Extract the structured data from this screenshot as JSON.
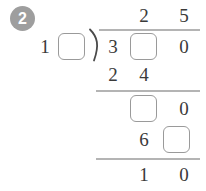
{
  "problem": {
    "badge_label": "2",
    "divisor": {
      "tens": "1",
      "ones_box": ""
    },
    "quotient": {
      "tens": "2",
      "ones": "5"
    },
    "dividend": {
      "hundreds": "3",
      "tens_box": "",
      "ones": "0"
    },
    "subtract_first": {
      "tens": "2",
      "ones": "4"
    },
    "bring_down": {
      "tens_box": "",
      "ones": "0"
    },
    "subtract_second": {
      "tens": "6",
      "ones_box": ""
    },
    "remainder": {
      "tens": "1",
      "ones": "0"
    }
  },
  "colors": {
    "digit": "#3a3a3a",
    "box_border": "#9a9a9a",
    "rule": "#b4b4b4",
    "badge_bg": "#9e9e9e",
    "background": "#ffffff"
  }
}
